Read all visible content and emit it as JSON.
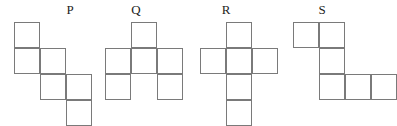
{
  "figure": {
    "background_color": "#ffffff",
    "stroke_color": "#7a7a7a",
    "label_color": "#1d1d1d",
    "cell_size_px": 26,
    "stroke_width_px": 1
  },
  "shapes": [
    {
      "id": "P",
      "label": "P",
      "label_x": 60,
      "label_y": 3,
      "origin_x": 14,
      "origin_y": 22,
      "cols": 3,
      "rows": 4,
      "cell_count": 6,
      "cells": [
        {
          "row": 0,
          "col": 0
        },
        {
          "row": 1,
          "col": 0
        },
        {
          "row": 1,
          "col": 1
        },
        {
          "row": 2,
          "col": 1
        },
        {
          "row": 2,
          "col": 2
        },
        {
          "row": 3,
          "col": 2
        }
      ]
    },
    {
      "id": "Q",
      "label": "Q",
      "label_x": 126,
      "label_y": 3,
      "origin_x": 105,
      "origin_y": 22,
      "cols": 3,
      "rows": 3,
      "cell_count": 6,
      "cells": [
        {
          "row": 0,
          "col": 1
        },
        {
          "row": 1,
          "col": 0
        },
        {
          "row": 1,
          "col": 1
        },
        {
          "row": 1,
          "col": 2
        },
        {
          "row": 2,
          "col": 0
        },
        {
          "row": 2,
          "col": 2
        }
      ]
    },
    {
      "id": "R",
      "label": "R",
      "label_x": 216,
      "label_y": 3,
      "origin_x": 200,
      "origin_y": 22,
      "cols": 3,
      "rows": 4,
      "cell_count": 6,
      "cells": [
        {
          "row": 0,
          "col": 1
        },
        {
          "row": 1,
          "col": 0
        },
        {
          "row": 1,
          "col": 1
        },
        {
          "row": 1,
          "col": 2
        },
        {
          "row": 2,
          "col": 1
        },
        {
          "row": 3,
          "col": 1
        }
      ]
    },
    {
      "id": "S",
      "label": "S",
      "label_x": 312,
      "label_y": 3,
      "origin_x": 293,
      "origin_y": 22,
      "cols": 4,
      "rows": 3,
      "cell_count": 6,
      "cells": [
        {
          "row": 0,
          "col": 0
        },
        {
          "row": 0,
          "col": 1
        },
        {
          "row": 1,
          "col": 1
        },
        {
          "row": 2,
          "col": 1
        },
        {
          "row": 2,
          "col": 2
        },
        {
          "row": 2,
          "col": 3
        }
      ]
    }
  ]
}
